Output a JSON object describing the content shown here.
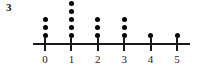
{
  "problem": {
    "number": "3"
  },
  "chart_data": {
    "type": "scatter",
    "plot_kind": "dot-plot",
    "title": "",
    "subtitle": "",
    "xlabel": "",
    "ylabel": "",
    "categories": [
      "0",
      "1",
      "2",
      "3",
      "4",
      "5"
    ],
    "x": [
      0,
      1,
      2,
      3,
      4,
      5
    ],
    "values": [
      3,
      5,
      3,
      3,
      1,
      1
    ],
    "tick_labels": [
      "0",
      "1",
      "2",
      "3",
      "4",
      "5"
    ],
    "xlim": [
      -0.5,
      5.6
    ],
    "ylim": [
      0,
      5
    ],
    "grid": false,
    "legend": false,
    "legend_position": "none",
    "dot_color": "#000000",
    "axis_color": "#1a1a1a",
    "background_color": "#ffffff",
    "total_dots": 16,
    "annotations": []
  }
}
